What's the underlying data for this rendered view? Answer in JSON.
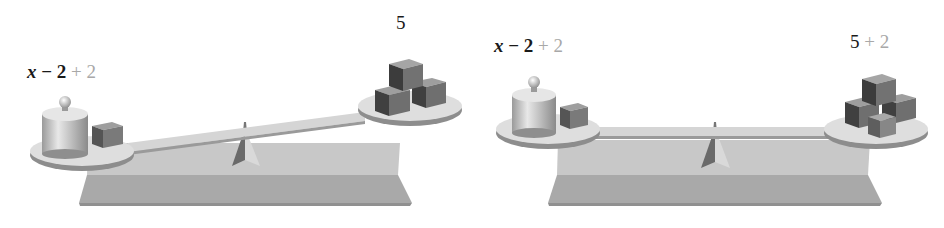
{
  "colors": {
    "dark_text": "#1a1a1a",
    "added_term": "#a8a8a8",
    "base_top": "#c9c9c9",
    "base_front": "#a9a9a9",
    "pan": "#dcdcdc",
    "cube_dark": "#3e3e3e",
    "cube_mid": "#6e6e6e"
  },
  "scales": [
    {
      "state": "tilted",
      "left": {
        "expr_var": "x",
        "expr_op": "−",
        "expr_num": "2",
        "added": "+ 2",
        "items": [
          "weight-x",
          "cube"
        ]
      },
      "right": {
        "expr_num": "5",
        "added": "",
        "items": [
          "cube",
          "cube",
          "cube"
        ]
      }
    },
    {
      "state": "balanced",
      "left": {
        "expr_var": "x",
        "expr_op": "−",
        "expr_num": "2",
        "added": "+ 2",
        "items": [
          "weight-x",
          "cube"
        ]
      },
      "right": {
        "expr_num": "5",
        "added": "+ 2",
        "items": [
          "cube",
          "cube",
          "cube",
          "cube"
        ]
      }
    }
  ]
}
